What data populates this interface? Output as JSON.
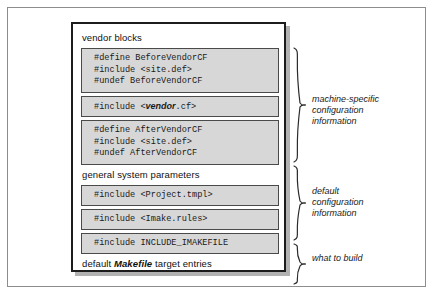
{
  "diagram": {
    "sections": [
      {
        "label": "vendor blocks"
      },
      {
        "label": "general system parameters"
      }
    ],
    "footer_label_prefix": "default ",
    "footer_label_emphasis": "Makefile",
    "footer_label_suffix": " target entries",
    "code_blocks": [
      {
        "id": "before-vendor-cf",
        "lines": [
          "#define BeforeVendorCF",
          "#include <site.def>",
          "#undef BeforeVendorCF"
        ]
      },
      {
        "id": "vendor-cf",
        "prefix": "#include <",
        "variable": "vendor",
        "suffix": ".cf>"
      },
      {
        "id": "after-vendor-cf",
        "lines": [
          "#define AfterVendorCF",
          "#include <site.def>",
          "#undef AfterVendorCF"
        ]
      },
      {
        "id": "project-tmpl",
        "lines": [
          "#include <Project.tmpl>"
        ]
      },
      {
        "id": "imake-rules",
        "lines": [
          "#include <Imake.rules>"
        ]
      },
      {
        "id": "include-imakefile",
        "lines": [
          "#include INCLUDE_IMAKEFILE"
        ]
      }
    ],
    "annotations": [
      {
        "id": "machine-specific",
        "text": "machine-specific\nconfiguration\ninformation"
      },
      {
        "id": "default-config",
        "text": "default\nconfiguration\ninformation"
      },
      {
        "id": "what-to-build",
        "text": "what to build"
      }
    ]
  },
  "colors": {
    "code_block_fill": "#d7d7d7",
    "code_block_border": "#4a4a4a",
    "box_border": "#1c1c1c",
    "frame_border": "#8d8d8d",
    "shadow": "#b2b2b2",
    "text": "#1a1a1a"
  }
}
